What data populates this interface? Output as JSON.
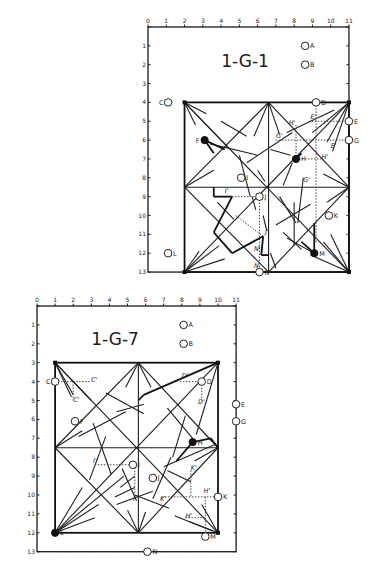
{
  "diagrams": [
    {
      "id": "top",
      "title": "1-G-1",
      "origin": [
        148,
        27
      ],
      "unit": [
        18.27,
        18.85
      ],
      "col_ticks": [
        "0",
        "1",
        "2",
        "3",
        "4",
        "5",
        "6",
        "7",
        "8",
        "9",
        "10",
        "11"
      ],
      "row_ticks": [
        "",
        "1",
        "2",
        "3",
        "4",
        "5",
        "6",
        "7",
        "8",
        "9",
        "10",
        "11",
        "12",
        "13"
      ],
      "title_pos": [
        5.7,
        2.1
      ],
      "inner_square": [
        2,
        4,
        11,
        13
      ],
      "points": [
        {
          "label": "A",
          "col": 8.6,
          "row": 1.0,
          "type": "open"
        },
        {
          "label": "B",
          "col": 8.6,
          "row": 2.0,
          "type": "open"
        },
        {
          "label": "C",
          "col": 1.1,
          "row": 4.0,
          "type": "open"
        },
        {
          "label": "D",
          "col": 9.2,
          "row": 4.0,
          "type": "open"
        },
        {
          "label": "E",
          "col": 11.0,
          "row": 5.0,
          "type": "open"
        },
        {
          "label": "G",
          "col": 11.0,
          "row": 6.0,
          "type": "open"
        },
        {
          "label": "F",
          "col": 3.1,
          "row": 6.0,
          "type": "filled"
        },
        {
          "label": "H",
          "col": 8.1,
          "row": 7.0,
          "type": "filled"
        },
        {
          "label": "I",
          "col": 5.1,
          "row": 8.0,
          "type": "open"
        },
        {
          "label": "J",
          "col": 6.1,
          "row": 9.0,
          "type": "open"
        },
        {
          "label": "K",
          "col": 9.9,
          "row": 10.0,
          "type": "open"
        },
        {
          "label": "L",
          "col": 1.1,
          "row": 12.0,
          "type": "open"
        },
        {
          "label": "M",
          "col": 9.1,
          "row": 12.0,
          "type": "filled"
        },
        {
          "label": "N",
          "col": 6.1,
          "row": 13.0,
          "type": "open"
        }
      ],
      "annotations": [
        {
          "text": "H'",
          "col": 7.7,
          "row": 5.2
        },
        {
          "text": "E'",
          "col": 8.9,
          "row": 4.9
        },
        {
          "text": "G'",
          "col": 7.0,
          "row": 5.9
        },
        {
          "text": "E'",
          "col": 10.0,
          "row": 6.4
        },
        {
          "text": "H'",
          "col": 9.5,
          "row": 7.0
        },
        {
          "text": "G'",
          "col": 8.5,
          "row": 8.2
        },
        {
          "text": "I'",
          "col": 4.2,
          "row": 8.8
        },
        {
          "text": "J'",
          "col": 6.4,
          "row": 11.0
        },
        {
          "text": "N'",
          "col": 5.8,
          "row": 11.9
        },
        {
          "text": "N",
          "col": 5.8,
          "row": 12.8
        }
      ],
      "lines": [
        [
          2,
          4,
          11,
          13
        ],
        [
          11,
          4,
          2,
          13
        ],
        [
          6.6,
          4,
          6.6,
          13
        ],
        [
          2,
          8.5,
          11,
          8.5
        ],
        [
          2,
          8.5,
          6.6,
          4
        ],
        [
          6.6,
          4,
          11,
          8.5
        ],
        [
          11,
          8.5,
          6.6,
          13
        ],
        [
          6.6,
          13,
          2,
          8.5
        ],
        [
          2,
          4,
          3.2,
          4.6
        ],
        [
          2,
          4,
          2.6,
          5.2
        ],
        [
          2,
          4,
          4.4,
          6.4
        ],
        [
          11,
          4,
          9.0,
          5.6
        ],
        [
          11,
          4,
          9.8,
          6.1
        ],
        [
          11,
          4,
          10.1,
          6.6
        ],
        [
          11,
          13,
          9.6,
          11.4
        ],
        [
          11,
          13,
          8.9,
          12.1
        ],
        [
          11,
          13,
          10.0,
          11.0
        ],
        [
          2,
          13,
          2.8,
          11.9
        ],
        [
          2,
          13,
          3.9,
          11.6
        ],
        [
          2,
          13,
          4.2,
          12.3
        ],
        [
          6.6,
          4,
          5.8,
          5.8
        ],
        [
          6.6,
          4,
          7.2,
          5.7
        ],
        [
          2,
          8.5,
          3.6,
          7.6
        ],
        [
          11,
          8.5,
          9.6,
          7.8
        ],
        [
          11,
          8.5,
          9.8,
          9.3
        ],
        [
          4.0,
          5.0,
          5.4,
          5.8
        ],
        [
          3.4,
          6.2,
          6.0,
          6.8
        ],
        [
          6.7,
          6.5,
          7.8,
          6.8
        ],
        [
          5.4,
          7.2,
          7.9,
          5.6
        ],
        [
          7.6,
          5.6,
          10.2,
          4.4
        ],
        [
          5.0,
          6.8,
          5.6,
          9.0
        ],
        [
          6.0,
          7.6,
          6.4,
          8.2
        ],
        [
          7.2,
          9.0,
          8.1,
          10.4
        ],
        [
          8.0,
          9.3,
          8.0,
          11.6
        ],
        [
          8.5,
          8.0,
          8.2,
          10.4
        ],
        [
          7.0,
          10.5,
          8.9,
          9.4
        ],
        [
          7.4,
          10.9,
          8.4,
          11.8
        ],
        [
          7.6,
          11.2,
          9.1,
          12.0
        ],
        [
          3.8,
          9.3,
          4.7,
          10.2
        ],
        [
          5.7,
          9.0,
          5.9,
          9.7
        ],
        [
          6.3,
          10.0,
          6.5,
          10.8
        ],
        [
          6.7,
          12.0,
          7.0,
          12.8
        ],
        [
          7.4,
          8.4,
          7.9,
          7.2
        ]
      ],
      "thick_lines": [
        [
          3.1,
          6.0,
          4.2,
          6.5
        ],
        [
          3.1,
          6.0,
          3.6,
          6.7
        ],
        [
          8.1,
          7.0,
          8.4,
          6.7
        ],
        [
          4.6,
          9.0,
          3.6,
          10.9
        ],
        [
          3.6,
          10.9,
          4.6,
          12.0
        ],
        [
          4.6,
          12.0,
          6.3,
          11.1
        ],
        [
          6.3,
          11.1,
          6.2,
          12.1
        ],
        [
          6.2,
          12.1,
          6.6,
          12.1
        ],
        [
          3.6,
          8.5,
          3.6,
          9.0
        ],
        [
          3.6,
          9.0,
          4.6,
          9.0
        ],
        [
          9.1,
          12.0,
          9.1,
          10.4
        ],
        [
          9.1,
          12.0,
          8.4,
          11.4
        ]
      ],
      "dotted_lines": [
        [
          4.6,
          9.0,
          6.1,
          9.0
        ],
        [
          6.1,
          9.0,
          6.1,
          13.0
        ],
        [
          7.0,
          6.0,
          11.0,
          6.0
        ],
        [
          8.8,
          5.0,
          11.0,
          5.0
        ],
        [
          9.2,
          4.0,
          9.2,
          11.4
        ],
        [
          8.1,
          5.2,
          8.1,
          7.0
        ],
        [
          8.1,
          7.0,
          9.5,
          7.0
        ],
        [
          4.8,
          10.0,
          6.3,
          11.1
        ]
      ]
    },
    {
      "id": "bottom",
      "title": "1-G-7",
      "origin": [
        37,
        306
      ],
      "unit": [
        18.1,
        18.9
      ],
      "col_ticks": [
        "0",
        "1",
        "2",
        "3",
        "4",
        "5",
        "6",
        "7",
        "8",
        "9",
        "10",
        "11"
      ],
      "row_ticks": [
        "",
        "1",
        "2",
        "3",
        "4",
        "5",
        "6",
        "7",
        "8",
        "9",
        "10",
        "11",
        "12",
        "13"
      ],
      "title_pos": [
        4.3,
        1.8
      ],
      "inner_square": [
        1,
        3,
        10,
        12
      ],
      "points": [
        {
          "label": "A",
          "col": 8.1,
          "row": 1.0,
          "type": "open"
        },
        {
          "label": "B",
          "col": 8.1,
          "row": 2.0,
          "type": "open"
        },
        {
          "label": "C",
          "col": 1.0,
          "row": 4.0,
          "type": "open"
        },
        {
          "label": "D",
          "col": 9.1,
          "row": 4.0,
          "type": "open"
        },
        {
          "label": "E",
          "col": 11.0,
          "row": 5.2,
          "type": "open"
        },
        {
          "label": "G",
          "col": 11.0,
          "row": 6.1,
          "type": "open"
        },
        {
          "label": "F",
          "col": 2.1,
          "row": 6.1,
          "type": "open"
        },
        {
          "label": "H",
          "col": 8.6,
          "row": 7.2,
          "type": "filled"
        },
        {
          "label": "I",
          "col": 5.3,
          "row": 8.4,
          "type": "open"
        },
        {
          "label": "J",
          "col": 6.4,
          "row": 9.1,
          "type": "open"
        },
        {
          "label": "K",
          "col": 10.0,
          "row": 10.1,
          "type": "open"
        },
        {
          "label": "L",
          "col": 1.0,
          "row": 12.0,
          "type": "filled"
        },
        {
          "label": "M",
          "col": 9.3,
          "row": 12.2,
          "type": "open"
        },
        {
          "label": "N",
          "col": 6.1,
          "row": 13.0,
          "type": "open"
        }
      ],
      "annotations": [
        {
          "text": "C'",
          "col": 3.0,
          "row": 4.0
        },
        {
          "text": "C'",
          "col": 2.0,
          "row": 5.1
        },
        {
          "text": "D'",
          "col": 8.0,
          "row": 3.8
        },
        {
          "text": "D'",
          "col": 8.9,
          "row": 5.2
        },
        {
          "text": "I'",
          "col": 3.1,
          "row": 8.3
        },
        {
          "text": "K'",
          "col": 8.5,
          "row": 8.7
        },
        {
          "text": "I'",
          "col": 5.3,
          "row": 10.3
        },
        {
          "text": "K'",
          "col": 6.8,
          "row": 10.3
        },
        {
          "text": "H'",
          "col": 9.2,
          "row": 9.9
        },
        {
          "text": "H'",
          "col": 8.2,
          "row": 11.2
        }
      ],
      "lines": [
        [
          1,
          3,
          10,
          12
        ],
        [
          10,
          3,
          1,
          12
        ],
        [
          5.6,
          3,
          5.6,
          12
        ],
        [
          1,
          7.5,
          10,
          7.5
        ],
        [
          1,
          7.5,
          5.6,
          3
        ],
        [
          5.6,
          3,
          10,
          7.5
        ],
        [
          10,
          7.5,
          5.6,
          12
        ],
        [
          5.6,
          12,
          1,
          7.5
        ],
        [
          1,
          3,
          2.0,
          4.7
        ],
        [
          1,
          3,
          3.0,
          5.0
        ],
        [
          1,
          3,
          1.9,
          4.8
        ],
        [
          10,
          3,
          8.8,
          6.8
        ],
        [
          1,
          12,
          2.5,
          9.6
        ],
        [
          1,
          12,
          3.4,
          10.5
        ],
        [
          1,
          12,
          4.8,
          9.0
        ],
        [
          1,
          12,
          3.2,
          11.2
        ],
        [
          10,
          12,
          8.4,
          11.4
        ],
        [
          10,
          12,
          9.1,
          10.5
        ],
        [
          5.6,
          12,
          5.0,
          10.8
        ],
        [
          5.6,
          12,
          6.0,
          10.9
        ],
        [
          5.6,
          3,
          4.9,
          4.3
        ],
        [
          5.6,
          3,
          6.3,
          4.3
        ],
        [
          1,
          7.5,
          2.5,
          6.6
        ],
        [
          10,
          7.5,
          8.7,
          8.2
        ],
        [
          3.8,
          4.6,
          5.9,
          5.7
        ],
        [
          4.4,
          5.6,
          5.9,
          5.2
        ],
        [
          2.3,
          6.9,
          4.9,
          5.6
        ],
        [
          3.1,
          6.2,
          4.1,
          8.9
        ],
        [
          3.8,
          6.9,
          2.9,
          9.2
        ],
        [
          7.2,
          5.4,
          8.6,
          7.0
        ],
        [
          8.2,
          5.8,
          7.5,
          8.0
        ],
        [
          7.0,
          8.5,
          9.9,
          7.3
        ],
        [
          4.7,
          8.6,
          5.5,
          10.3
        ],
        [
          4.6,
          9.6,
          5.4,
          9.0
        ],
        [
          4.3,
          10.1,
          5.4,
          9.6
        ],
        [
          4.4,
          10.5,
          6.4,
          9.8
        ],
        [
          5.4,
          10.0,
          7.3,
          10.7
        ],
        [
          6.4,
          10.2,
          7.4,
          8.0
        ],
        [
          7.2,
          8.7,
          8.5,
          9.3
        ],
        [
          7.6,
          11.1,
          9.7,
          11.9
        ]
      ],
      "thick_lines": [
        [
          5.6,
          5.0,
          5.9,
          4.7
        ],
        [
          5.9,
          4.7,
          10,
          3
        ],
        [
          8.6,
          7.2,
          9.6,
          7.0
        ],
        [
          9.6,
          7.0,
          10,
          7.5
        ],
        [
          8.6,
          7.2,
          7.7,
          8.2
        ],
        [
          1,
          12,
          1.2,
          12.0
        ]
      ],
      "dotted_lines": [
        [
          1.0,
          4.0,
          3.0,
          4.0
        ],
        [
          2.0,
          4.0,
          2.0,
          5.0
        ],
        [
          7.9,
          4.0,
          9.1,
          4.0
        ],
        [
          9.1,
          4.0,
          9.1,
          5.0
        ],
        [
          3.2,
          8.4,
          5.3,
          8.4
        ],
        [
          5.4,
          8.4,
          5.4,
          10.0
        ],
        [
          8.5,
          8.7,
          8.5,
          10.1
        ],
        [
          6.9,
          10.1,
          10.0,
          10.1
        ],
        [
          8.2,
          11.2,
          9.3,
          11.2
        ],
        [
          9.3,
          10.1,
          9.3,
          12.2
        ],
        [
          1,
          13,
          11,
          13
        ]
      ]
    }
  ]
}
